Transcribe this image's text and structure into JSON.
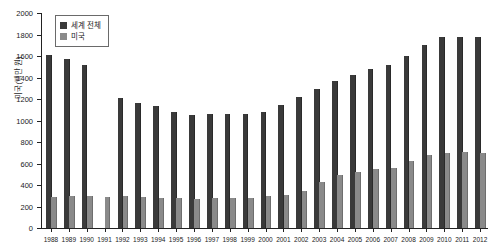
{
  "chart_data": {
    "type": "bar",
    "title": "",
    "xlabel": "",
    "ylabel": "미국(백만 원)",
    "ylim": [
      0,
      2000
    ],
    "ytick_step": 200,
    "yticks": [
      0,
      200,
      400,
      600,
      800,
      1000,
      1200,
      1400,
      1600,
      1800,
      2000
    ],
    "grid": false,
    "legend_position": "top-left",
    "categories": [
      "1988",
      "1989",
      "1990",
      "1991",
      "1992",
      "1993",
      "1994",
      "1995",
      "1996",
      "1997",
      "1998",
      "1999",
      "2000",
      "2001",
      "2002",
      "2003",
      "2004",
      "2005",
      "2006",
      "2007",
      "2008",
      "2009",
      "2010",
      "2011",
      "2012"
    ],
    "series": [
      {
        "name": "세계 전체",
        "color": "#3a3a3a",
        "values": [
          1610,
          1570,
          1520,
          null,
          1205,
          1165,
          1135,
          1080,
          1055,
          1065,
          1060,
          1060,
          1080,
          1145,
          1215,
          1290,
          1370,
          1420,
          1480,
          1515,
          1600,
          1700,
          1775,
          1775,
          1775
        ]
      },
      {
        "name": "미국",
        "color": "#8a8a8a",
        "values": [
          288,
          300,
          297,
          288,
          297,
          288,
          281,
          275,
          272,
          275,
          275,
          281,
          297,
          310,
          345,
          430,
          495,
          520,
          545,
          555,
          620,
          675,
          700,
          705,
          700
        ]
      }
    ]
  },
  "legend": {
    "items": [
      {
        "label": "세계 전체",
        "color": "#3a3a3a"
      },
      {
        "label": "미국",
        "color": "#8a8a8a"
      }
    ]
  },
  "axis": {
    "y_title": "미국(백만 원)"
  }
}
